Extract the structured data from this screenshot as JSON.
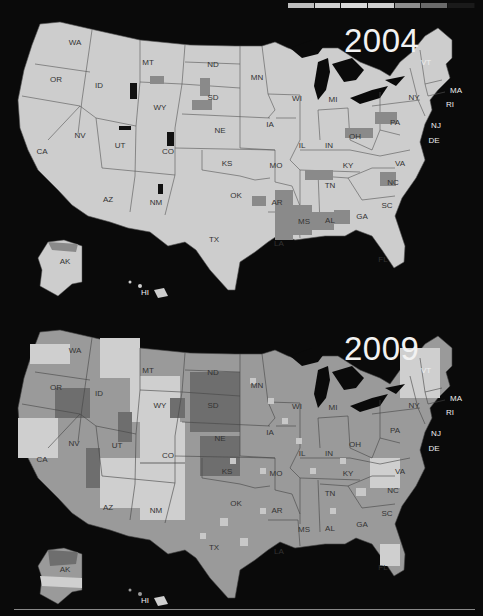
{
  "legend": {
    "label": "",
    "segments": [
      "#bdbdbd",
      "#d0d0d0",
      "#d9d9d9",
      "#cfcfcf",
      "#8e8e8e",
      "#6a6a6a",
      "#1a1a1a"
    ]
  },
  "maps": [
    {
      "year": "2004",
      "top": 0
    },
    {
      "year": "2009",
      "top": 308
    }
  ],
  "states": [
    "WA",
    "OR",
    "CA",
    "ID",
    "NV",
    "MT",
    "WY",
    "UT",
    "AZ",
    "CO",
    "NM",
    "ND",
    "SD",
    "NE",
    "KS",
    "OK",
    "TX",
    "MN",
    "IA",
    "MO",
    "AR",
    "LA",
    "WI",
    "IL",
    "MI",
    "IN",
    "OH",
    "KY",
    "TN",
    "MS",
    "AL",
    "GA",
    "FL",
    "SC",
    "NC",
    "VA",
    "PA",
    "NY",
    "VT",
    "MA",
    "RI",
    "CT",
    "NJ",
    "DE",
    "MD",
    "AK",
    "HI"
  ],
  "colors": {
    "background": "#0a0a0a",
    "land_2004": "#cdcdcd",
    "land_2009": "#9a9a9a",
    "border": "#555555",
    "label": "#333333"
  },
  "chart_data": {
    "type": "choropleth",
    "title": "",
    "panels": [
      "2004",
      "2009"
    ],
    "legend_bins": 7
  }
}
